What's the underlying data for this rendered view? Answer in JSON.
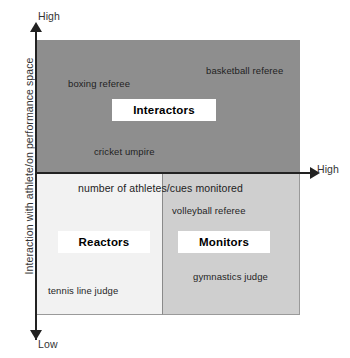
{
  "chart_data": {
    "type": "scatter",
    "title": "",
    "xlabel": "number of athletes/cues monitored",
    "ylabel": "Interaction with athlete/on performance space",
    "x_axis_high_label": "High",
    "y_axis_high_label": "High",
    "y_axis_low_label": "Low",
    "grid": false,
    "legend": "none",
    "quadrants": [
      {
        "id": "interactors",
        "label": "Interactors",
        "position": "top",
        "fill": "#8e8e8e",
        "interaction": "high",
        "cues_monitored": "spans low to high",
        "examples": [
          "boxing referee",
          "basketball referee",
          "cricket umpire"
        ]
      },
      {
        "id": "reactors",
        "label": "Reactors",
        "position": "bottom-left",
        "fill": "#f2f2f2",
        "interaction": "low",
        "cues_monitored": "low",
        "examples": [
          "tennis line judge"
        ]
      },
      {
        "id": "monitors",
        "label": "Monitors",
        "position": "bottom-right",
        "fill": "#cfcfcf",
        "interaction": "low",
        "cues_monitored": "high",
        "examples": [
          "volleyball referee",
          "gymnastics judge"
        ]
      }
    ],
    "points": [
      {
        "label": "boxing referee",
        "quadrant": "interactors",
        "x": 0.2,
        "y": 0.78
      },
      {
        "label": "basketball referee",
        "quadrant": "interactors",
        "x": 0.74,
        "y": 0.87
      },
      {
        "label": "cricket umpire",
        "quadrant": "interactors",
        "x": 0.32,
        "y": 0.55
      },
      {
        "label": "volleyball referee",
        "quadrant": "monitors",
        "x": 0.56,
        "y": 0.38
      },
      {
        "label": "gymnastics judge",
        "quadrant": "monitors",
        "x": 0.68,
        "y": 0.14
      },
      {
        "label": "tennis line judge",
        "quadrant": "reactors",
        "x": 0.08,
        "y": 0.06
      }
    ]
  },
  "axes": {
    "y_high": "High",
    "y_low": "Low",
    "x_high": "High",
    "y_title": "Interaction with athlete/on performance space",
    "x_title": "number of athletes/cues monitored"
  },
  "categories": {
    "interactors": "Interactors",
    "reactors": "Reactors",
    "monitors": "Monitors"
  },
  "roles": {
    "boxing": "boxing referee",
    "basketball": "basketball referee",
    "cricket": "cricket umpire",
    "volleyball": "volleyball referee",
    "gymnastics": "gymnastics judge",
    "tennis": "tennis line judge"
  },
  "colors": {
    "quadrant_top": "#8e8e8e",
    "quadrant_bottom_left": "#f2f2f2",
    "quadrant_bottom_right": "#cfcfcf",
    "axis": "#222222",
    "box_fill": "#ffffff"
  }
}
